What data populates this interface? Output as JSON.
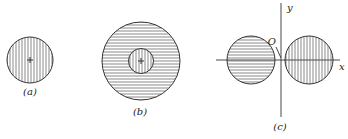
{
  "figure": {
    "panels": [
      {
        "id": "a",
        "label": "(a)",
        "description": "single circle with vertical hatching and center cross"
      },
      {
        "id": "b",
        "label": "(b)",
        "description": "large circle with horizontal hatching containing smaller concentric circle with vertical hatching and center cross"
      },
      {
        "id": "c",
        "label": "(c)",
        "description": "two circles on x-axis either side of y-axis; left horizontal hatching, right vertical hatching"
      }
    ],
    "axes": {
      "x_label": "x",
      "y_label": "y",
      "origin_label": "O"
    },
    "colors": {
      "stroke": "#333333",
      "hatch": "#555555",
      "background": "#ffffff"
    }
  }
}
